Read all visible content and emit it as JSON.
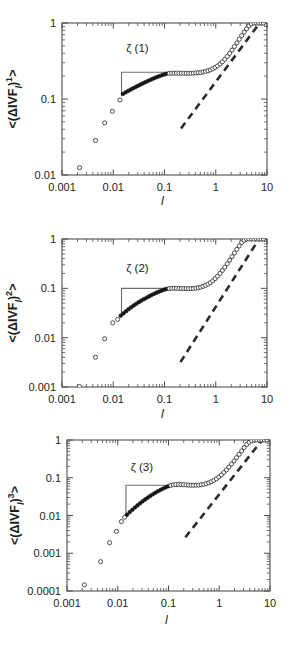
{
  "figure": {
    "kind": "multi-panel-log-log-scatter",
    "panel_count": 3,
    "background_color": "#ffffff",
    "foreground_color": "#1d1d1d"
  },
  "chart_data": [
    {
      "type": "scatter",
      "panel_id": "panel-1",
      "title": "",
      "xlabel": "l",
      "ylabel": "<(ΔIVFₗ)¹>",
      "xscale": "log",
      "yscale": "log",
      "xlim": [
        0.001,
        10
      ],
      "ylim": [
        0.01,
        1
      ],
      "xticks": [
        "0.001",
        "0.01",
        "0.1",
        "1",
        "10"
      ],
      "xtick_values": [
        0.001,
        0.01,
        0.1,
        1,
        10
      ],
      "yticks": [
        "0.01",
        "0.1",
        "1"
      ],
      "ytick_values": [
        0.01,
        0.1,
        1
      ],
      "grid": false,
      "legend": null,
      "annotations": [
        {
          "text": "ζ (1)",
          "x": 0.018,
          "y": 0.42,
          "kind": "slope-triangle-label"
        }
      ],
      "slope_guide": {
        "kind": "right-angle-step",
        "x_start": 0.0145,
        "x_end": 0.105,
        "y_low": 0.108,
        "y_high": 0.225
      },
      "reference_dashed_line": {
        "kind": "power-law-guide",
        "x": [
          0.21,
          7.2
        ],
        "y": [
          0.041,
          1.0
        ]
      },
      "series": [
        {
          "name": "open-circles-low-l",
          "marker": "open-circle",
          "x": [
            0.0022,
            0.0045,
            0.0068,
            0.0096,
            0.0135
          ],
          "y": [
            0.0125,
            0.0285,
            0.0485,
            0.069,
            0.097
          ]
        },
        {
          "name": "filled-circles-scaling-range",
          "marker": "filled-circle",
          "x": [
            0.0155,
            0.0175,
            0.0196,
            0.0219,
            0.0244,
            0.0272,
            0.0303,
            0.0338,
            0.0377,
            0.042,
            0.0468,
            0.0521,
            0.0581,
            0.0647,
            0.0721,
            0.0803,
            0.0895,
            0.0997,
            0.1111
          ],
          "y": [
            0.117,
            0.1225,
            0.1278,
            0.1331,
            0.1384,
            0.1437,
            0.1492,
            0.1547,
            0.1604,
            0.1661,
            0.1719,
            0.1778,
            0.1836,
            0.1894,
            0.1951,
            0.2007,
            0.2061,
            0.2112,
            0.2158
          ]
        },
        {
          "name": "open-circles-plateau-and-rise",
          "marker": "open-circle",
          "x": [
            0.1238,
            0.138,
            0.1538,
            0.1714,
            0.191,
            0.2129,
            0.2373,
            0.2645,
            0.2948,
            0.3286,
            0.3662,
            0.4082,
            0.455,
            0.5071,
            0.5652,
            0.63,
            0.7022,
            0.7827,
            0.8724,
            0.9724,
            1.0839,
            1.2081,
            1.3466,
            1.501,
            1.6731,
            1.8649,
            2.0787,
            2.317,
            2.5826,
            2.8787,
            3.2087,
            3.5765,
            3.9865,
            4.4435,
            4.9529,
            5.5207,
            6.1537,
            6.8592,
            7.6455,
            8.522
          ],
          "y": [
            0.2176,
            0.2186,
            0.219,
            0.219,
            0.2188,
            0.2185,
            0.2182,
            0.218,
            0.218,
            0.2183,
            0.2189,
            0.2199,
            0.2214,
            0.2235,
            0.2264,
            0.2302,
            0.2352,
            0.2416,
            0.2497,
            0.26,
            0.2728,
            0.2888,
            0.3086,
            0.333,
            0.3626,
            0.3983,
            0.4406,
            0.4901,
            0.547,
            0.6112,
            0.682,
            0.758,
            0.837,
            0.916,
            0.97,
            1.0,
            1.0,
            1.0,
            1.0,
            1.0
          ]
        }
      ]
    },
    {
      "type": "scatter",
      "panel_id": "panel-2",
      "title": "",
      "xlabel": "l",
      "ylabel": "<(ΔIVFₗ)²>",
      "xscale": "log",
      "yscale": "log",
      "xlim": [
        0.001,
        10
      ],
      "ylim": [
        0.001,
        1
      ],
      "xticks": [
        "0.001",
        "0.01",
        "0.1",
        "1",
        "10"
      ],
      "xtick_values": [
        0.001,
        0.01,
        0.1,
        1,
        10
      ],
      "yticks": [
        "0.001",
        "0.01",
        "0.1",
        "1"
      ],
      "ytick_values": [
        0.001,
        0.01,
        0.1,
        1
      ],
      "grid": false,
      "legend": null,
      "annotations": [
        {
          "text": "ζ (2)",
          "x": 0.018,
          "y": 0.215,
          "kind": "slope-triangle-label"
        }
      ],
      "slope_guide": {
        "kind": "right-angle-step",
        "x_start": 0.0145,
        "x_end": 0.107,
        "y_low": 0.0285,
        "y_high": 0.1
      },
      "reference_dashed_line": {
        "kind": "power-law-guide",
        "x": [
          0.205,
          7.0
        ],
        "y": [
          0.0032,
          1.0
        ]
      },
      "series": [
        {
          "name": "open-circles-low-l",
          "marker": "open-circle",
          "x": [
            0.0022,
            0.0045,
            0.0068,
            0.0098,
            0.0122
          ],
          "y": [
            0.00102,
            0.004,
            0.0095,
            0.02,
            0.0235
          ]
        },
        {
          "name": "filled-circles-scaling-range",
          "marker": "filled-circle",
          "x": [
            0.014,
            0.0158,
            0.0178,
            0.02,
            0.0224,
            0.0251,
            0.0281,
            0.0315,
            0.0353,
            0.0396,
            0.0444,
            0.0497,
            0.0557,
            0.0625,
            0.07,
            0.0785,
            0.088,
            0.0986,
            0.1105
          ],
          "y": [
            0.028,
            0.0312,
            0.0345,
            0.0379,
            0.0414,
            0.045,
            0.0487,
            0.0525,
            0.0564,
            0.0604,
            0.0645,
            0.0687,
            0.073,
            0.0774,
            0.0818,
            0.086,
            0.09,
            0.094,
            0.0975
          ]
        },
        {
          "name": "open-circles-plateau-and-rise",
          "marker": "open-circle",
          "x": [
            0.1238,
            0.138,
            0.1538,
            0.1714,
            0.191,
            0.2129,
            0.2373,
            0.2645,
            0.2948,
            0.3286,
            0.3662,
            0.4082,
            0.455,
            0.5071,
            0.5652,
            0.63,
            0.7022,
            0.7827,
            0.8724,
            0.9724,
            1.0839,
            1.2081,
            1.3466,
            1.501,
            1.6731,
            1.8649,
            2.0787,
            2.317,
            2.5826,
            2.8787,
            3.2087,
            3.5765,
            3.9865,
            4.4435,
            4.9529,
            5.5207,
            6.1537,
            6.8592,
            7.6455,
            8.522
          ],
          "y": [
            0.099,
            0.1,
            0.1003,
            0.1001,
            0.0998,
            0.0993,
            0.0989,
            0.0986,
            0.0985,
            0.0988,
            0.0995,
            0.1008,
            0.1027,
            0.1055,
            0.1094,
            0.1146,
            0.1215,
            0.1305,
            0.1422,
            0.1572,
            0.1763,
            0.2004,
            0.2306,
            0.2683,
            0.3147,
            0.3716,
            0.4404,
            0.5222,
            0.6176,
            0.726,
            0.845,
            0.94,
            1.0,
            1.0,
            1.0,
            1.0,
            1.0,
            1.0,
            1.0,
            1.0
          ]
        }
      ]
    },
    {
      "type": "scatter",
      "panel_id": "panel-3",
      "title": "",
      "xlabel": "l",
      "ylabel": "<(ΔIVFₗ)³>",
      "xscale": "log",
      "yscale": "log",
      "xlim": [
        0.001,
        10
      ],
      "ylim": [
        0.0001,
        1
      ],
      "xticks": [
        "0.001",
        "0.01",
        "0.1",
        "1",
        "10"
      ],
      "xtick_values": [
        0.001,
        0.01,
        0.1,
        1,
        10
      ],
      "yticks": [
        "0.0001",
        "0.001",
        "0.01",
        "0.1",
        "1"
      ],
      "ytick_values": [
        0.0001,
        0.001,
        0.01,
        0.1,
        1
      ],
      "grid": false,
      "legend": null,
      "annotations": [
        {
          "text": "ζ (3)",
          "x": 0.018,
          "y": 0.155,
          "kind": "slope-triangle-label"
        }
      ],
      "slope_guide": {
        "kind": "right-angle-step",
        "x_start": 0.0145,
        "x_end": 0.105,
        "y_low": 0.0098,
        "y_high": 0.063
      },
      "reference_dashed_line": {
        "kind": "power-law-guide",
        "x": [
          0.215,
          7.0
        ],
        "y": [
          0.00265,
          1.0
        ]
      },
      "series": [
        {
          "name": "open-circles-low-l",
          "marker": "open-circle",
          "x": [
            0.0022,
            0.0046,
            0.0069,
            0.0094,
            0.0118,
            0.0137
          ],
          "y": [
            0.000145,
            0.0006,
            0.0019,
            0.0038,
            0.0069,
            0.009
          ]
        },
        {
          "name": "filled-circles-scaling-range",
          "marker": "filled-circle",
          "x": [
            0.0152,
            0.0172,
            0.0194,
            0.0218,
            0.0245,
            0.0275,
            0.0309,
            0.0347,
            0.039,
            0.0438,
            0.0492,
            0.0553,
            0.0621,
            0.0698,
            0.0784,
            0.0881,
            0.099
          ],
          "y": [
            0.0105,
            0.0123,
            0.0142,
            0.0163,
            0.0186,
            0.0211,
            0.0238,
            0.0267,
            0.0298,
            0.0331,
            0.0366,
            0.0402,
            0.044,
            0.0479,
            0.0518,
            0.0557,
            0.0595
          ]
        },
        {
          "name": "open-circles-plateau-and-rise",
          "marker": "open-circle",
          "x": [
            0.111,
            0.1245,
            0.1396,
            0.1566,
            0.1756,
            0.197,
            0.2209,
            0.2478,
            0.2779,
            0.3117,
            0.3496,
            0.3921,
            0.4398,
            0.4932,
            0.5532,
            0.6205,
            0.696,
            0.7806,
            0.8755,
            0.982,
            1.1014,
            1.2354,
            1.3857,
            1.5542,
            1.7432,
            1.9553,
            2.1931,
            2.4598,
            2.759,
            3.0946,
            3.471,
            3.8932,
            4.3667,
            4.8979,
            5.4936,
            6.1618,
            6.9113,
            7.7519,
            8.6948
          ],
          "y": [
            0.063,
            0.065,
            0.066,
            0.0663,
            0.066,
            0.0654,
            0.0646,
            0.0639,
            0.0634,
            0.0632,
            0.0634,
            0.064,
            0.0652,
            0.067,
            0.0697,
            0.0734,
            0.0784,
            0.085,
            0.0936,
            0.1048,
            0.1192,
            0.1378,
            0.1615,
            0.1918,
            0.2303,
            0.279,
            0.3404,
            0.4174,
            0.513,
            0.63,
            0.76,
            0.87,
            0.95,
            1.0,
            1.0,
            1.0,
            1.0,
            1.0,
            1.0
          ]
        }
      ]
    }
  ]
}
